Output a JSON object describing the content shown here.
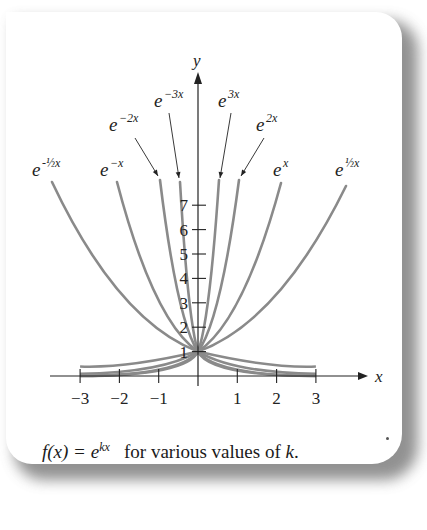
{
  "figure": {
    "caption_func": "f(x) = e",
    "caption_exp": "kx",
    "caption_rest": "for various values of",
    "caption_var": "k",
    "caption_end": "."
  },
  "chart_data": {
    "type": "line",
    "xlabel": "x",
    "ylabel": "y",
    "x_ticks": [
      -3,
      -2,
      -1,
      1,
      2,
      3
    ],
    "y_ticks": [
      1,
      2,
      3,
      4,
      5,
      6,
      7
    ],
    "xlim": [
      -3,
      3
    ],
    "ylim": [
      0,
      7.5
    ],
    "grid": false,
    "legend": "inline labels with arrows",
    "series": [
      {
        "name": "e^{-1/2 x}",
        "k": -0.5,
        "label": "e",
        "sup": "-½x",
        "top_px": [
          52,
          182
        ],
        "label_px": [
          32,
          176
        ]
      },
      {
        "name": "e^{-x}",
        "k": -1,
        "label": "e",
        "sup": "−x",
        "top_px": [
          117,
          182
        ],
        "label_px": [
          100,
          176
        ]
      },
      {
        "name": "e^{-2x}",
        "k": -2,
        "label": "e",
        "sup": "−2x",
        "top_px": [
          160,
          180
        ],
        "label_px": [
          109,
          131
        ]
      },
      {
        "name": "e^{-3x}",
        "k": -3,
        "label": "e",
        "sup": "−3x",
        "top_px": [
          180,
          182
        ],
        "label_px": [
          154,
          107
        ]
      },
      {
        "name": "e^{3x}",
        "k": 3,
        "label": "e",
        "sup": "3x",
        "top_px": [
          219,
          180
        ],
        "label_px": [
          218,
          107
        ]
      },
      {
        "name": "e^{2x}",
        "k": 2,
        "label": "e",
        "sup": "2x",
        "top_px": [
          239,
          180
        ],
        "label_px": [
          256,
          131
        ]
      },
      {
        "name": "e^{x}",
        "k": 1,
        "label": "e",
        "sup": "x",
        "top_px": [
          281,
          183
        ],
        "label_px": [
          273,
          176
        ]
      },
      {
        "name": "e^{1/2 x}",
        "k": 0.5,
        "label": "e",
        "sup": "½x",
        "top_px": [
          346,
          186
        ],
        "label_px": [
          335,
          176
        ]
      }
    ]
  }
}
